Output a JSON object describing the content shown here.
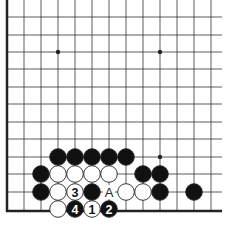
{
  "diagram": {
    "type": "go-board-corner",
    "grid": {
      "columns_x": [
        7,
        24,
        41,
        58,
        75,
        92,
        109,
        126,
        143,
        160,
        177,
        194,
        211
      ],
      "rows_y": [
        17,
        35,
        52,
        69,
        87,
        104,
        122,
        139,
        157,
        174,
        192,
        209
      ],
      "line_extent_right": 222,
      "line_top": 0,
      "left_edge_x": 7,
      "bottom_edge_y": 211
    },
    "star_points": [
      {
        "col": 3,
        "row": 2
      },
      {
        "col": 9,
        "row": 2
      },
      {
        "col": 9,
        "row": 8
      }
    ],
    "stones": [
      {
        "col": 3,
        "row": 8,
        "color": "black",
        "label": ""
      },
      {
        "col": 4,
        "row": 8,
        "color": "black",
        "label": ""
      },
      {
        "col": 5,
        "row": 8,
        "color": "black",
        "label": ""
      },
      {
        "col": 6,
        "row": 8,
        "color": "black",
        "label": ""
      },
      {
        "col": 7,
        "row": 8,
        "color": "black",
        "label": ""
      },
      {
        "col": 2,
        "row": 9,
        "color": "black",
        "label": ""
      },
      {
        "col": 3,
        "row": 9,
        "color": "white",
        "label": ""
      },
      {
        "col": 4,
        "row": 9,
        "color": "white",
        "label": ""
      },
      {
        "col": 5,
        "row": 9,
        "color": "white",
        "label": ""
      },
      {
        "col": 6,
        "row": 9,
        "color": "white",
        "label": ""
      },
      {
        "col": 8,
        "row": 9,
        "color": "black",
        "label": ""
      },
      {
        "col": 9,
        "row": 9,
        "color": "black",
        "label": ""
      },
      {
        "col": 2,
        "row": 10,
        "color": "black",
        "label": ""
      },
      {
        "col": 3,
        "row": 10,
        "color": "white",
        "label": ""
      },
      {
        "col": 4,
        "row": 10,
        "color": "white",
        "label": "3"
      },
      {
        "col": 5,
        "row": 10,
        "color": "black",
        "label": ""
      },
      {
        "col": 7,
        "row": 10,
        "color": "white",
        "label": ""
      },
      {
        "col": 8,
        "row": 10,
        "color": "white",
        "label": ""
      },
      {
        "col": 9,
        "row": 10,
        "color": "black",
        "label": ""
      },
      {
        "col": 11,
        "row": 10,
        "color": "black",
        "label": ""
      },
      {
        "col": 3,
        "row": 11,
        "color": "white",
        "label": ""
      },
      {
        "col": 4,
        "row": 11,
        "color": "black",
        "label": "4"
      },
      {
        "col": 5,
        "row": 11,
        "color": "white",
        "label": "1"
      },
      {
        "col": 6,
        "row": 11,
        "color": "black",
        "label": "2"
      }
    ],
    "marks": [
      {
        "col": 6,
        "row": 10,
        "text": "A"
      }
    ],
    "colors": {
      "line": "#333333",
      "edge": "#222222",
      "black_stone": "#111111",
      "white_stone": "#ffffff",
      "stone_outline": "#222222",
      "background": "#ffffff"
    }
  }
}
